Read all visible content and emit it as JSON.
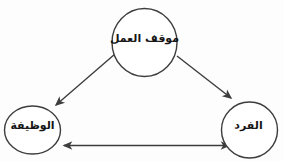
{
  "diagram": {
    "type": "concept-diagram",
    "background_color": "#fdfdfd",
    "stroke_color": "#3d3d3d",
    "text_color": "#161616",
    "nodes": {
      "work_attitude": {
        "label": "موقف العمل",
        "shape": "circle",
        "position": "top-center"
      },
      "job": {
        "label": "الوظيفة",
        "shape": "circle",
        "position": "bottom-left"
      },
      "individual": {
        "label": "الفرد",
        "shape": "circle",
        "position": "bottom-right"
      }
    },
    "edges": [
      {
        "from": "work_attitude",
        "to": "job",
        "direction": "one-way"
      },
      {
        "from": "work_attitude",
        "to": "individual",
        "direction": "one-way"
      },
      {
        "from": "job",
        "to": "individual",
        "direction": "two-way"
      }
    ]
  }
}
